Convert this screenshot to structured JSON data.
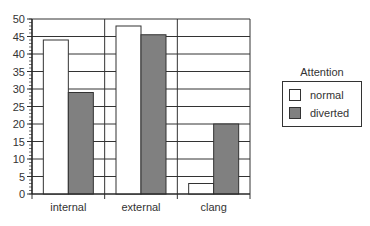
{
  "chart_data": {
    "type": "bar",
    "title": "",
    "xlabel": "",
    "ylabel": "",
    "categories": [
      "internal",
      "external",
      "clang"
    ],
    "series": [
      {
        "name": "normal",
        "values": [
          44,
          48,
          3
        ],
        "color": "#ffffff"
      },
      {
        "name": "diverted",
        "values": [
          29,
          45.5,
          20
        ],
        "color": "#808080"
      }
    ],
    "ylim": [
      0,
      50
    ],
    "yticks": [
      0,
      5,
      10,
      15,
      20,
      25,
      30,
      35,
      40,
      45,
      50
    ],
    "grid": true,
    "legend": {
      "title": "Attention",
      "position": "right"
    }
  },
  "legend": {
    "title": "Attention",
    "items": [
      {
        "label": "normal",
        "color": "#ffffff"
      },
      {
        "label": "diverted",
        "color": "#808080"
      }
    ]
  }
}
